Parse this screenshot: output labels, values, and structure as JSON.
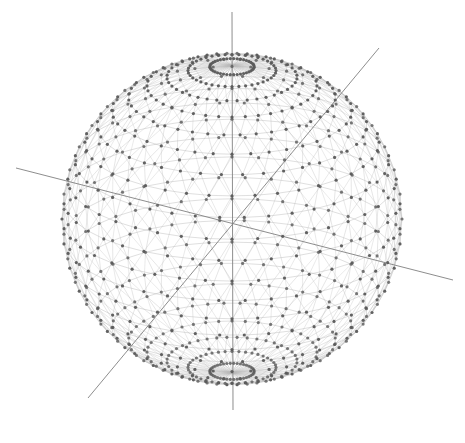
{
  "diagram": {
    "type": "3d-wireframe-sphere",
    "background": "#ffffff",
    "colors": {
      "mesh_line": "#b8b8b8",
      "vertex": "#5a5a5a",
      "axis": "#808080"
    },
    "sphere": {
      "center": [
        232,
        219
      ],
      "radius": 170,
      "latitude_rings": 24,
      "longitude_segments": 40,
      "tilt_deg": 22,
      "vertex_dot_radius": 1.6
    },
    "axes": [
      {
        "name": "vertical-axis",
        "from": [
          232,
          12
        ],
        "to": [
          233,
          410
        ]
      },
      {
        "name": "horizontal-axis",
        "from": [
          16,
          168
        ],
        "to": [
          453,
          280
        ]
      },
      {
        "name": "diagonal-axis",
        "from": [
          379,
          48
        ],
        "to": [
          88,
          398
        ]
      }
    ],
    "poles": [
      {
        "name": "north-pole",
        "center": [
          232,
          86
        ]
      },
      {
        "name": "south-pole",
        "center": [
          234,
          358
        ]
      }
    ]
  }
}
